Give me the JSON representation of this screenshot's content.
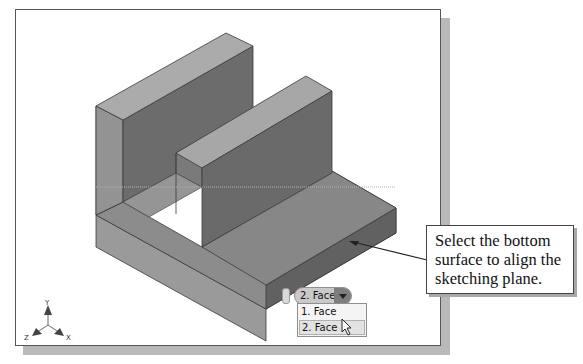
{
  "viewport": {
    "background": "#ffffff",
    "model": {
      "name": "slotted-bracket-part",
      "colors": {
        "top_face": "#a9a9a9",
        "front_face": "#6e6e6e",
        "side_face": "#8b8b8b",
        "base_top": "#8f8f8f",
        "edge": "#3a3a3a"
      }
    },
    "triad": {
      "x_label": "X",
      "y_label": "Y",
      "z_label": "Z"
    }
  },
  "selection_tool": {
    "current_value": "2. Face",
    "options": [
      {
        "label": "1. Face",
        "highlighted": false
      },
      {
        "label": "2. Face",
        "highlighted": true
      }
    ]
  },
  "callout": {
    "text_line1": "Select the bottom",
    "text_line2": "surface to align the",
    "text_line3": "sketching plane."
  }
}
